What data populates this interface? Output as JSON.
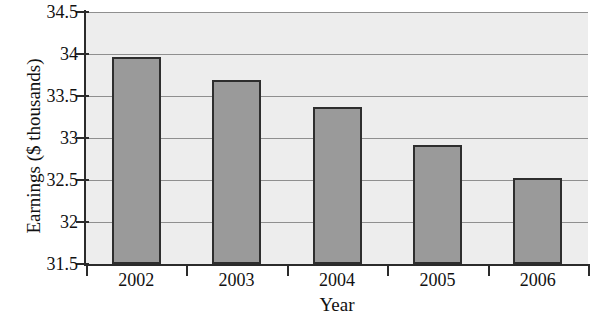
{
  "chart_data": {
    "type": "bar",
    "title": "",
    "xlabel": "Year",
    "ylabel": "Earnings ($ thousands)",
    "categories": [
      "2002",
      "2003",
      "2004",
      "2005",
      "2006"
    ],
    "values": [
      33.96,
      33.69,
      33.37,
      32.92,
      32.52
    ],
    "series": [
      {
        "name": "Earnings",
        "values": [
          33.96,
          33.69,
          33.37,
          32.92,
          32.52
        ]
      }
    ],
    "ylim": [
      31.5,
      34.5
    ],
    "ytick_labels": [
      "34.5",
      "34",
      "33.5",
      "33",
      "32.5",
      "32",
      "31.5"
    ],
    "ytick_values": [
      34.5,
      34,
      33.5,
      33,
      32.5,
      32,
      31.5
    ],
    "grid": true,
    "legend": null,
    "legend_position": "none",
    "colors": {
      "bar_fill": "#9a9a9a",
      "bar_edge": "#2e2e2e",
      "plot_background": "#ededed",
      "gridline": "#8f8f8f",
      "axis": "#2b2b2b",
      "text": "#111111"
    }
  }
}
